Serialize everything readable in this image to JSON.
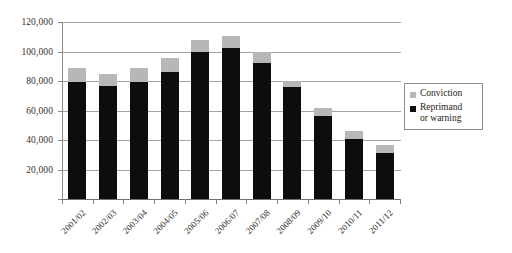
{
  "chart_data": {
    "type": "bar",
    "subtype": "stacked-column",
    "title": "",
    "xlabel": "",
    "ylabel": "",
    "ylim": [
      0,
      120000
    ],
    "ytick_values": [
      0,
      20000,
      40000,
      60000,
      80000,
      100000,
      120000
    ],
    "ytick_labels": [
      "",
      "20,000",
      "40,000",
      "60,000",
      "80,000",
      "100,000",
      "120,000"
    ],
    "grid": true,
    "legend_position": "right",
    "categories": [
      "2001/02",
      "2002/03",
      "2003/04",
      "2004/05",
      "2005/06",
      "2006/07",
      "2007/08",
      "2008/09",
      "2009/10",
      "2010/11",
      "2011/12"
    ],
    "series": [
      {
        "name": "Reprimand or warning",
        "color": "#0d0d0d",
        "values": [
          79000,
          76500,
          79000,
          86000,
          99500,
          102500,
          92000,
          76000,
          56500,
          40500,
          31000
        ]
      },
      {
        "name": "Conviction",
        "color": "#b7b7b7",
        "values": [
          9500,
          8000,
          9500,
          9500,
          8300,
          8000,
          7500,
          4000,
          5500,
          5500,
          5500
        ]
      }
    ],
    "totals": [
      88500,
      84500,
      88500,
      95500,
      107800,
      110500,
      99500,
      80000,
      62000,
      46000,
      36500
    ]
  },
  "legend": {
    "items": [
      {
        "label": "Conviction",
        "color": "#b7b7b7"
      },
      {
        "label": "Reprimand",
        "label2": "or warning",
        "color": "#0d0d0d"
      }
    ]
  }
}
